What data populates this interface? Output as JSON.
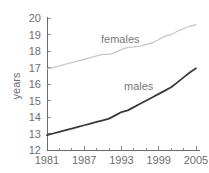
{
  "chart_data": {
    "type": "line",
    "title": "",
    "xlabel": "",
    "ylabel": "years",
    "ylim": [
      12,
      20
    ],
    "xlim": [
      1981,
      2005
    ],
    "grid": false,
    "legend": "inline-labels",
    "ytick_labels": [
      "20",
      "19",
      "18",
      "17",
      "16",
      "15",
      "14",
      "13",
      "12"
    ],
    "yticks": [
      20,
      19,
      18,
      17,
      16,
      15,
      14,
      13,
      12
    ],
    "xtick_labels": [
      "1981",
      "1987",
      "1993",
      "1999",
      "2005"
    ],
    "xticks": [
      1981,
      1987,
      1993,
      1999,
      2005
    ],
    "minor_xticks": [
      1983,
      1985,
      1989,
      1991,
      1995,
      1997,
      2001,
      2003
    ],
    "x": [
      1981,
      1982,
      1983,
      1984,
      1985,
      1986,
      1987,
      1988,
      1989,
      1990,
      1991,
      1992,
      1993,
      1994,
      1995,
      1996,
      1997,
      1998,
      1999,
      2000,
      2001,
      2002,
      2003,
      2004,
      2005
    ],
    "series": [
      {
        "name": "females",
        "color": "#c9c9c9",
        "label": "females",
        "values": [
          16.9,
          17.0,
          17.1,
          17.2,
          17.3,
          17.4,
          17.5,
          17.6,
          17.7,
          17.8,
          17.8,
          17.9,
          18.1,
          18.2,
          18.25,
          18.3,
          18.4,
          18.5,
          18.7,
          18.9,
          19.0,
          19.2,
          19.35,
          19.5,
          19.6
        ]
      },
      {
        "name": "males",
        "color": "#3a3a3a",
        "label": "males",
        "values": [
          12.9,
          13.0,
          13.1,
          13.2,
          13.3,
          13.4,
          13.5,
          13.6,
          13.7,
          13.8,
          13.9,
          14.1,
          14.3,
          14.4,
          14.6,
          14.8,
          15.0,
          15.2,
          15.4,
          15.6,
          15.8,
          16.1,
          16.4,
          16.7,
          16.95
        ]
      }
    ]
  },
  "labels": {
    "females": "females",
    "males": "males",
    "y_axis_title": "years"
  }
}
